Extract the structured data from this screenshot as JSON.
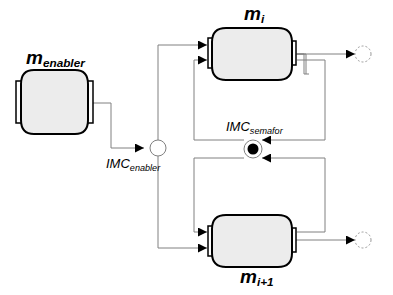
{
  "diagram": {
    "nodes": {
      "m_enabler": {
        "label": "m",
        "sub": "enabler"
      },
      "m_i": {
        "label": "m",
        "sub": "i"
      },
      "m_i1": {
        "label": "m",
        "sub": "i+1"
      },
      "imc_enabler": {
        "label": "IMC",
        "sub": "enabler"
      },
      "imc_semafor": {
        "label": "IMC",
        "sub": "semafor"
      }
    },
    "colors": {
      "machine_fill": "#ececec",
      "machine_stroke": "#000000",
      "edge": "#808080",
      "token": "#000000",
      "output_dashed": "#9a9a9a"
    }
  }
}
